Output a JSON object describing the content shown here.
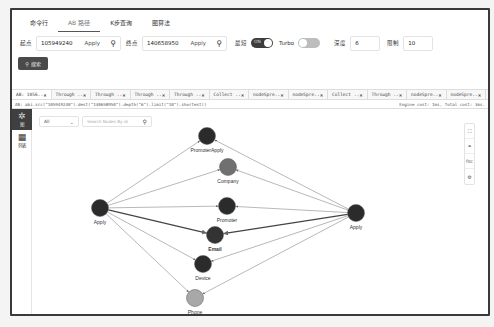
{
  "top_tabs": [
    {
      "label": "命令行",
      "active": false
    },
    {
      "label": "AB 路径",
      "active": true
    },
    {
      "label": "K步查询",
      "active": false
    },
    {
      "label": "图算法",
      "active": false
    }
  ],
  "query_form": {
    "start_label": "起点",
    "start_value": "105949240",
    "start_type": "Apply",
    "end_label": "终点",
    "end_value": "140658950",
    "end_type": "Apply",
    "shortest_label": "最短",
    "shortest_toggle": "ON",
    "turbo_label": "Turbo",
    "depth_label": "深度",
    "depth_value": "6",
    "limit_label": "限制",
    "limit_value": "10",
    "search_button": "搜索",
    "search_icon": "⚲"
  },
  "result_tabs": [
    {
      "label": "AB: 1056..",
      "active": true
    },
    {
      "label": "Through ..",
      "active": false
    },
    {
      "label": "Through ..",
      "active": false
    },
    {
      "label": "Through ..",
      "active": false
    },
    {
      "label": "Through ..",
      "active": false
    },
    {
      "label": "Collect ..",
      "active": false
    },
    {
      "label": "nodeSpre..",
      "active": false
    },
    {
      "label": "nodeSpre..",
      "active": false
    },
    {
      "label": "Collect ..",
      "active": false
    },
    {
      "label": "Through ..",
      "active": false
    },
    {
      "label": "nodeSpre..",
      "active": false
    },
    {
      "label": "nodeSpre..",
      "active": false
    }
  ],
  "query_bar": {
    "query": "AB: abi.src(\"105949240\").dest(\"140658950\").depth(\"6\").limit(\"10\").shortest()",
    "cost": "Engine cost: 1ms, Total cost: 3ms."
  },
  "sidebar": {
    "items": [
      {
        "label": "图",
        "icon": "graph-icon",
        "glyph": "✲",
        "active": true
      },
      {
        "label": "列表",
        "icon": "table-icon",
        "glyph": "▦",
        "active": false
      }
    ]
  },
  "filter": {
    "select_value": "All",
    "search_placeholder": "Search Nodes By id"
  },
  "right_tools": [
    {
      "name": "fullscreen",
      "glyph": "⛶"
    },
    {
      "name": "link",
      "glyph": "⚭"
    },
    {
      "name": "fsc",
      "glyph": "fsc"
    },
    {
      "name": "settings",
      "glyph": "⚙"
    }
  ],
  "graph": {
    "nodes": [
      {
        "id": "apply_left",
        "label": "Apply",
        "x": 88,
        "y": 198,
        "color": "#2b2b2b"
      },
      {
        "id": "apply_right",
        "label": "Apply",
        "x": 344,
        "y": 203,
        "color": "#2b2b2b"
      },
      {
        "id": "promoter_apply",
        "label": "PromoterApply",
        "x": 195,
        "y": 126,
        "color": "#2b2b2b"
      },
      {
        "id": "company",
        "label": "Company",
        "x": 216,
        "y": 157,
        "color": "#707070"
      },
      {
        "id": "promoter",
        "label": "Promoter",
        "x": 215,
        "y": 196,
        "color": "#2b2b2b"
      },
      {
        "id": "email",
        "label": "Email",
        "x": 203,
        "y": 225,
        "color": "#333333"
      },
      {
        "id": "device",
        "label": "Device",
        "x": 191,
        "y": 254,
        "color": "#2b2b2b"
      },
      {
        "id": "phone",
        "label": "Phone",
        "x": 183,
        "y": 288,
        "color": "#a8a8a8"
      }
    ],
    "edges": [
      {
        "from": "apply_left",
        "to": "promoter_apply"
      },
      {
        "from": "apply_left",
        "to": "company"
      },
      {
        "from": "apply_left",
        "to": "promoter"
      },
      {
        "from": "apply_left",
        "to": "email",
        "bold": true
      },
      {
        "from": "apply_left",
        "to": "device"
      },
      {
        "from": "apply_left",
        "to": "phone"
      },
      {
        "from": "apply_right",
        "to": "promoter_apply"
      },
      {
        "from": "apply_right",
        "to": "company"
      },
      {
        "from": "apply_right",
        "to": "promoter"
      },
      {
        "from": "apply_right",
        "to": "email",
        "bold": true
      },
      {
        "from": "apply_right",
        "to": "device"
      },
      {
        "from": "apply_right",
        "to": "phone"
      }
    ]
  }
}
